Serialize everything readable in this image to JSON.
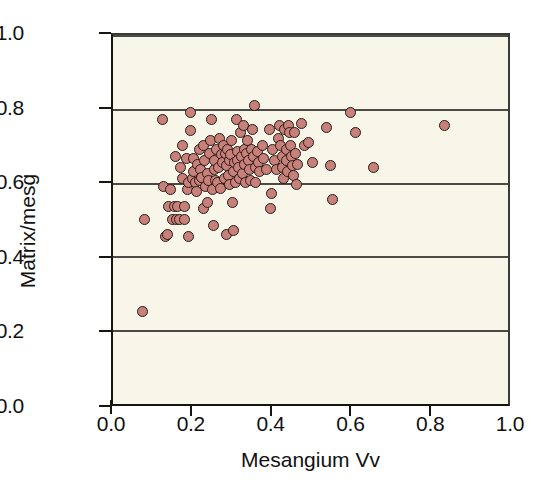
{
  "chart_data": {
    "type": "scatter",
    "title": "",
    "xlabel": "Mesangium Vv",
    "ylabel": "Matrix/mesg",
    "xlim": [
      0.0,
      1.0
    ],
    "ylim": [
      0.0,
      1.0
    ],
    "xticks": [
      "0.0",
      "0.2",
      "0.4",
      "0.6",
      "0.8",
      "1.0"
    ],
    "yticks": [
      "0.0",
      "0.2",
      "0.4",
      "0.6",
      "0.8",
      "1.0"
    ],
    "xtick_values": [
      0.0,
      0.2,
      0.4,
      0.6,
      0.8,
      1.0
    ],
    "ytick_values": [
      0.0,
      0.2,
      0.4,
      0.6,
      0.8,
      1.0
    ],
    "grid": "horizontal",
    "gridline_values": [
      0.2,
      0.4,
      0.6,
      0.8,
      1.0
    ],
    "legend": "none",
    "marker_color": "#c8817a",
    "marker_edge_color": "#2b1a16",
    "plot_background": "#f8f5e9",
    "series": [
      {
        "name": "glomeruli",
        "n_points": 142,
        "points": [
          [
            0.075,
            0.25
          ],
          [
            0.08,
            0.5
          ],
          [
            0.125,
            0.77
          ],
          [
            0.128,
            0.59
          ],
          [
            0.132,
            0.455
          ],
          [
            0.138,
            0.458
          ],
          [
            0.14,
            0.535
          ],
          [
            0.145,
            0.58
          ],
          [
            0.15,
            0.5
          ],
          [
            0.155,
            0.535
          ],
          [
            0.158,
            0.67
          ],
          [
            0.16,
            0.5
          ],
          [
            0.163,
            0.535
          ],
          [
            0.168,
            0.5
          ],
          [
            0.172,
            0.64
          ],
          [
            0.175,
            0.7
          ],
          [
            0.177,
            0.61
          ],
          [
            0.18,
            0.5
          ],
          [
            0.182,
            0.535
          ],
          [
            0.185,
            0.665
          ],
          [
            0.188,
            0.58
          ],
          [
            0.19,
            0.6
          ],
          [
            0.192,
            0.455
          ],
          [
            0.195,
            0.79
          ],
          [
            0.197,
            0.74
          ],
          [
            0.2,
            0.61
          ],
          [
            0.203,
            0.665
          ],
          [
            0.205,
            0.63
          ],
          [
            0.208,
            0.6
          ],
          [
            0.212,
            0.575
          ],
          [
            0.215,
            0.65
          ],
          [
            0.218,
            0.605
          ],
          [
            0.22,
            0.69
          ],
          [
            0.222,
            0.635
          ],
          [
            0.225,
            0.615
          ],
          [
            0.228,
            0.53
          ],
          [
            0.23,
            0.7
          ],
          [
            0.232,
            0.66
          ],
          [
            0.235,
            0.59
          ],
          [
            0.238,
            0.545
          ],
          [
            0.24,
            0.625
          ],
          [
            0.242,
            0.605
          ],
          [
            0.245,
            0.68
          ],
          [
            0.248,
            0.715
          ],
          [
            0.25,
            0.77
          ],
          [
            0.252,
            0.58
          ],
          [
            0.254,
            0.485
          ],
          [
            0.256,
            0.635
          ],
          [
            0.258,
            0.66
          ],
          [
            0.26,
            0.605
          ],
          [
            0.262,
            0.69
          ],
          [
            0.265,
            0.6
          ],
          [
            0.268,
            0.64
          ],
          [
            0.27,
            0.72
          ],
          [
            0.272,
            0.585
          ],
          [
            0.275,
            0.675
          ],
          [
            0.277,
            0.655
          ],
          [
            0.28,
            0.7
          ],
          [
            0.282,
            0.61
          ],
          [
            0.285,
            0.68
          ],
          [
            0.287,
            0.645
          ],
          [
            0.288,
            0.46
          ],
          [
            0.29,
            0.69
          ],
          [
            0.292,
            0.62
          ],
          [
            0.294,
            0.66
          ],
          [
            0.296,
            0.595
          ],
          [
            0.298,
            0.675
          ],
          [
            0.3,
            0.715
          ],
          [
            0.302,
            0.545
          ],
          [
            0.304,
            0.63
          ],
          [
            0.306,
            0.47
          ],
          [
            0.308,
            0.655
          ],
          [
            0.31,
            0.6
          ],
          [
            0.312,
            0.77
          ],
          [
            0.314,
            0.685
          ],
          [
            0.316,
            0.66
          ],
          [
            0.318,
            0.64
          ],
          [
            0.32,
            0.61
          ],
          [
            0.322,
            0.735
          ],
          [
            0.325,
            0.67
          ],
          [
            0.327,
            0.625
          ],
          [
            0.33,
            0.755
          ],
          [
            0.332,
            0.69
          ],
          [
            0.334,
            0.65
          ],
          [
            0.336,
            0.6
          ],
          [
            0.338,
            0.68
          ],
          [
            0.34,
            0.715
          ],
          [
            0.342,
            0.66
          ],
          [
            0.345,
            0.635
          ],
          [
            0.348,
            0.605
          ],
          [
            0.35,
            0.69
          ],
          [
            0.352,
            0.745
          ],
          [
            0.355,
            0.67
          ],
          [
            0.358,
            0.81
          ],
          [
            0.36,
            0.64
          ],
          [
            0.362,
            0.6
          ],
          [
            0.365,
            0.685
          ],
          [
            0.368,
            0.655
          ],
          [
            0.372,
            0.63
          ],
          [
            0.378,
            0.7
          ],
          [
            0.382,
            0.665
          ],
          [
            0.388,
            0.635
          ],
          [
            0.395,
            0.745
          ],
          [
            0.398,
            0.53
          ],
          [
            0.4,
            0.57
          ],
          [
            0.405,
            0.69
          ],
          [
            0.41,
            0.66
          ],
          [
            0.415,
            0.635
          ],
          [
            0.418,
            0.72
          ],
          [
            0.422,
            0.755
          ],
          [
            0.425,
            0.7
          ],
          [
            0.428,
            0.67
          ],
          [
            0.43,
            0.64
          ],
          [
            0.432,
            0.61
          ],
          [
            0.435,
            0.745
          ],
          [
            0.438,
            0.69
          ],
          [
            0.44,
            0.66
          ],
          [
            0.442,
            0.63
          ],
          [
            0.445,
            0.755
          ],
          [
            0.448,
            0.735
          ],
          [
            0.45,
            0.7
          ],
          [
            0.452,
            0.67
          ],
          [
            0.455,
            0.645
          ],
          [
            0.458,
            0.62
          ],
          [
            0.46,
            0.735
          ],
          [
            0.462,
            0.68
          ],
          [
            0.465,
            0.595
          ],
          [
            0.468,
            0.65
          ],
          [
            0.478,
            0.76
          ],
          [
            0.485,
            0.7
          ],
          [
            0.495,
            0.71
          ],
          [
            0.505,
            0.655
          ],
          [
            0.54,
            0.75
          ],
          [
            0.55,
            0.645
          ],
          [
            0.555,
            0.555
          ],
          [
            0.6,
            0.79
          ],
          [
            0.615,
            0.735
          ],
          [
            0.66,
            0.64
          ],
          [
            0.84,
            0.755
          ]
        ]
      }
    ]
  },
  "axes": {
    "y_title": "Matrix/mesg",
    "x_title": "Mesangium Vv"
  },
  "caption_fragment": ""
}
